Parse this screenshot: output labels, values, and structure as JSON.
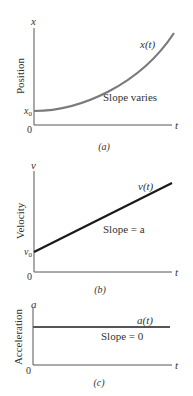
{
  "panels": [
    {
      "id": "a",
      "caption": "(a)",
      "ylabel": "Position",
      "yaxis_symbol": "x",
      "xaxis_symbol": "t",
      "origin_label": "0",
      "intercept_label": "x",
      "intercept_sub": "0",
      "curve_label": "x(t)",
      "annotation": "Slope varies",
      "curve_type": "parabola",
      "curve_color": "#7a7a7a"
    },
    {
      "id": "b",
      "caption": "(b)",
      "ylabel": "Velocity",
      "yaxis_symbol": "v",
      "xaxis_symbol": "t",
      "origin_label": "0",
      "intercept_label": "v",
      "intercept_sub": "0",
      "curve_label": "v(t)",
      "annotation": "Slope = a",
      "curve_type": "line",
      "curve_color": "#1a1a1a"
    },
    {
      "id": "c",
      "caption": "(c)",
      "ylabel": "Acceleration",
      "yaxis_symbol": "a",
      "xaxis_symbol": "t",
      "origin_label": "0",
      "curve_label": "a(t)",
      "annotation": "Slope = 0",
      "curve_type": "constant",
      "curve_color": "#555555"
    }
  ]
}
